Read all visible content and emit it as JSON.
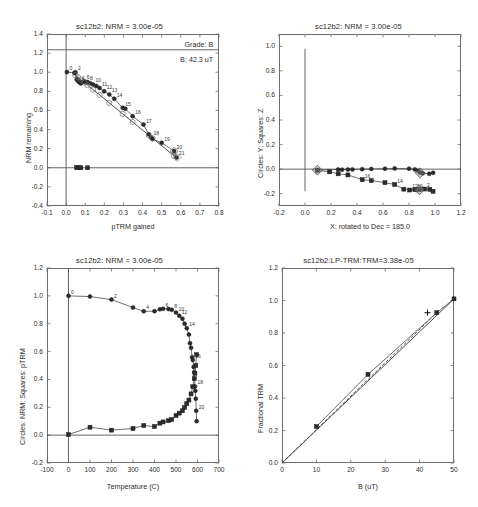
{
  "figure": {
    "width": 478,
    "height": 507,
    "background": "#ffffff",
    "specimen": "sc12b2"
  },
  "chart_data": [
    {
      "id": "arai-plot",
      "type": "scatter",
      "title": "sc12b2: NRM = 3.00e-05",
      "xlabel": "pTRM gained",
      "ylabel": "NRM remaining",
      "xlim": [
        -0.1,
        0.8
      ],
      "ylim": [
        -0.4,
        1.4
      ],
      "xticks": [
        "-0.1",
        "0.0",
        "0.1",
        "0.2",
        "0.3",
        "0.4",
        "0.5",
        "0.6",
        "0.7",
        "0.8"
      ],
      "yticks": [
        "-0.4",
        "-0.2",
        "0.0",
        "0.2",
        "0.4",
        "0.6",
        "0.8",
        "1.0",
        "1.2",
        "1.4"
      ],
      "grid": false,
      "annotations": [
        {
          "name": "grade-annotation",
          "text": "Grade: B",
          "x": 0.77,
          "y": 1.28
        },
        {
          "name": "field-annotation",
          "text": "B: 42.3 uT",
          "x": 0.77,
          "y": 1.13
        }
      ],
      "hlines": [
        1.235,
        0.0
      ],
      "vlines": [
        0.0
      ],
      "series": [
        {
          "name": "nrm-ptrm-circles",
          "marker": "circle",
          "points": [
            {
              "x": 0.004,
              "y": 1.002,
              "label": "0"
            },
            {
              "x": 0.043,
              "y": 0.992,
              "label": ""
            },
            {
              "x": 0.049,
              "y": 0.999,
              "label": "2"
            },
            {
              "x": 0.055,
              "y": 0.925,
              "label": ""
            },
            {
              "x": 0.062,
              "y": 0.908,
              "label": ""
            },
            {
              "x": 0.069,
              "y": 0.895,
              "label": "4"
            },
            {
              "x": 0.077,
              "y": 0.883,
              "label": ""
            },
            {
              "x": 0.086,
              "y": 0.9,
              "label": ""
            },
            {
              "x": 0.095,
              "y": 0.905,
              "label": "6"
            },
            {
              "x": 0.104,
              "y": 0.894,
              "label": ""
            },
            {
              "x": 0.112,
              "y": 0.898,
              "label": "8"
            },
            {
              "x": 0.126,
              "y": 0.885,
              "label": ""
            },
            {
              "x": 0.141,
              "y": 0.872,
              "label": "10"
            },
            {
              "x": 0.158,
              "y": 0.857,
              "label": ""
            },
            {
              "x": 0.175,
              "y": 0.836,
              "label": "11"
            },
            {
              "x": 0.199,
              "y": 0.8,
              "label": "12"
            },
            {
              "x": 0.226,
              "y": 0.768,
              "label": "13"
            },
            {
              "x": 0.252,
              "y": 0.722,
              "label": "14"
            },
            {
              "x": 0.296,
              "y": 0.627,
              "label": "15"
            },
            {
              "x": 0.31,
              "y": 0.618,
              "label": ""
            },
            {
              "x": 0.348,
              "y": 0.54,
              "label": "16"
            },
            {
              "x": 0.405,
              "y": 0.452,
              "label": "17"
            },
            {
              "x": 0.432,
              "y": 0.35,
              "label": ""
            },
            {
              "x": 0.444,
              "y": 0.318,
              "label": "18"
            },
            {
              "x": 0.452,
              "y": 0.3,
              "label": ""
            },
            {
              "x": 0.5,
              "y": 0.262,
              "label": "19"
            },
            {
              "x": 0.565,
              "y": 0.175,
              "label": "20"
            },
            {
              "x": 0.578,
              "y": 0.108,
              "label": "21"
            }
          ]
        },
        {
          "name": "ptrm-check-squares",
          "marker": "square",
          "points": [
            {
              "x": 0.055,
              "y": 0.002
            },
            {
              "x": 0.066,
              "y": 0.002
            },
            {
              "x": 0.077,
              "y": 0.0
            },
            {
              "x": 0.112,
              "y": 0.0
            }
          ]
        }
      ],
      "best_fit_line": {
        "x": [
          0.045,
          0.58
        ],
        "y": [
          0.975,
          0.1
        ]
      }
    },
    {
      "id": "zijderveld-plot",
      "type": "scatter",
      "title": "sc12b2: NRM = 3.00e-05",
      "xlabel": "X: rotated to Dec = 185.0",
      "ylabel": "Circles: Y; Squares: Z",
      "xlim": [
        -0.2,
        1.2
      ],
      "ylim": [
        -0.3,
        1.1
      ],
      "xticks": [
        "-0.2",
        "0.0",
        "0.2",
        "0.4",
        "0.6",
        "0.8",
        "1.0",
        "1.2"
      ],
      "yticks": [
        "-0.2",
        "0.0",
        "0.2",
        "0.4",
        "0.6",
        "0.8",
        "1.0"
      ],
      "grid": false,
      "hlines": [
        0.0
      ],
      "vlines": [
        0.0
      ],
      "series": [
        {
          "name": "y-component-circles",
          "marker": "circle",
          "points": [
            {
              "x": 0.095,
              "y": -0.007,
              "label": ""
            },
            {
              "x": 0.255,
              "y": -0.003,
              "label": ""
            },
            {
              "x": 0.285,
              "y": -0.004,
              "label": ""
            },
            {
              "x": 0.33,
              "y": -0.003,
              "label": ""
            },
            {
              "x": 0.365,
              "y": -0.002,
              "label": ""
            },
            {
              "x": 0.44,
              "y": 0.0,
              "label": ""
            },
            {
              "x": 0.51,
              "y": 0.002,
              "label": ""
            },
            {
              "x": 0.615,
              "y": 0.004,
              "label": ""
            },
            {
              "x": 0.69,
              "y": 0.006,
              "label": ""
            },
            {
              "x": 0.8,
              "y": 0.004,
              "label": ""
            },
            {
              "x": 0.845,
              "y": -0.002,
              "label": ""
            },
            {
              "x": 0.87,
              "y": -0.014,
              "label": ""
            },
            {
              "x": 0.885,
              "y": -0.028,
              "label": ""
            },
            {
              "x": 0.905,
              "y": -0.034,
              "label": ""
            },
            {
              "x": 0.955,
              "y": -0.038,
              "label": ""
            },
            {
              "x": 0.985,
              "y": -0.03,
              "label": ""
            }
          ]
        },
        {
          "name": "z-component-squares",
          "marker": "square",
          "points": [
            {
              "x": 0.095,
              "y": -0.01,
              "label": ""
            },
            {
              "x": 0.19,
              "y": -0.022,
              "label": ""
            },
            {
              "x": 0.255,
              "y": -0.038,
              "label": ""
            },
            {
              "x": 0.33,
              "y": -0.047,
              "label": ""
            },
            {
              "x": 0.44,
              "y": -0.086,
              "label": "16"
            },
            {
              "x": 0.51,
              "y": -0.093,
              "label": ""
            },
            {
              "x": 0.615,
              "y": -0.11,
              "label": ""
            },
            {
              "x": 0.69,
              "y": -0.125,
              "label": "14"
            },
            {
              "x": 0.76,
              "y": -0.163,
              "label": ""
            },
            {
              "x": 0.805,
              "y": -0.17,
              "label": "12"
            },
            {
              "x": 0.845,
              "y": -0.167,
              "label": "10"
            },
            {
              "x": 0.88,
              "y": -0.168,
              "label": ""
            },
            {
              "x": 0.92,
              "y": -0.162,
              "label": "2"
            },
            {
              "x": 0.96,
              "y": -0.165,
              "label": ""
            },
            {
              "x": 0.985,
              "y": -0.18,
              "label": ""
            }
          ]
        }
      ]
    },
    {
      "id": "nrm-ptrm-vs-temperature",
      "type": "line",
      "title": "sc12b2: NRM = 3.00e-05",
      "xlabel": "Temperature (C)",
      "ylabel": "Circles: NRM; Squares: pTRM",
      "xlim": [
        -100,
        700
      ],
      "ylim": [
        -0.2,
        1.2
      ],
      "xticks": [
        "-100",
        "0",
        "100",
        "200",
        "300",
        "400",
        "500",
        "600",
        "700"
      ],
      "yticks": [
        "-0.2",
        "0.0",
        "0.2",
        "0.4",
        "0.6",
        "0.8",
        "1.0",
        "1.2"
      ],
      "grid": false,
      "hlines": [
        0.0
      ],
      "vlines": [
        0.0
      ],
      "series": [
        {
          "name": "nrm-remaining",
          "marker": "circle",
          "points": [
            {
              "x": 0,
              "y": 1.0,
              "label": "0"
            },
            {
              "x": 100,
              "y": 0.995,
              "label": ""
            },
            {
              "x": 200,
              "y": 0.973,
              "label": "2"
            },
            {
              "x": 300,
              "y": 0.916,
              "label": ""
            },
            {
              "x": 350,
              "y": 0.889,
              "label": "4"
            },
            {
              "x": 400,
              "y": 0.89,
              "label": ""
            },
            {
              "x": 425,
              "y": 0.903,
              "label": ""
            },
            {
              "x": 440,
              "y": 0.907,
              "label": "6"
            },
            {
              "x": 465,
              "y": 0.905,
              "label": ""
            },
            {
              "x": 480,
              "y": 0.9,
              "label": "8"
            },
            {
              "x": 500,
              "y": 0.88,
              "label": "10"
            },
            {
              "x": 515,
              "y": 0.857,
              "label": "12"
            },
            {
              "x": 530,
              "y": 0.836,
              "label": ""
            },
            {
              "x": 540,
              "y": 0.8,
              "label": ""
            },
            {
              "x": 550,
              "y": 0.768,
              "label": "14"
            },
            {
              "x": 560,
              "y": 0.722,
              "label": ""
            },
            {
              "x": 565,
              "y": 0.66,
              "label": ""
            },
            {
              "x": 570,
              "y": 0.627,
              "label": ""
            },
            {
              "x": 575,
              "y": 0.56,
              "label": ""
            },
            {
              "x": 578,
              "y": 0.54,
              "label": "16"
            },
            {
              "x": 582,
              "y": 0.49,
              "label": ""
            },
            {
              "x": 585,
              "y": 0.452,
              "label": ""
            },
            {
              "x": 588,
              "y": 0.35,
              "label": "18"
            },
            {
              "x": 590,
              "y": 0.318,
              "label": ""
            },
            {
              "x": 592,
              "y": 0.262,
              "label": ""
            },
            {
              "x": 594,
              "y": 0.175,
              "label": "20"
            },
            {
              "x": 596,
              "y": 0.1,
              "label": ""
            }
          ]
        },
        {
          "name": "ptrm-gained",
          "marker": "square",
          "points": [
            {
              "x": 0,
              "y": 0.004,
              "label": ""
            },
            {
              "x": 100,
              "y": 0.057,
              "label": ""
            },
            {
              "x": 200,
              "y": 0.036,
              "label": ""
            },
            {
              "x": 300,
              "y": 0.048,
              "label": ""
            },
            {
              "x": 350,
              "y": 0.069,
              "label": ""
            },
            {
              "x": 400,
              "y": 0.062,
              "label": ""
            },
            {
              "x": 425,
              "y": 0.086,
              "label": ""
            },
            {
              "x": 440,
              "y": 0.095,
              "label": ""
            },
            {
              "x": 465,
              "y": 0.104,
              "label": ""
            },
            {
              "x": 480,
              "y": 0.112,
              "label": ""
            },
            {
              "x": 500,
              "y": 0.141,
              "label": ""
            },
            {
              "x": 515,
              "y": 0.158,
              "label": ""
            },
            {
              "x": 530,
              "y": 0.175,
              "label": ""
            },
            {
              "x": 540,
              "y": 0.199,
              "label": ""
            },
            {
              "x": 550,
              "y": 0.226,
              "label": ""
            },
            {
              "x": 560,
              "y": 0.252,
              "label": ""
            },
            {
              "x": 570,
              "y": 0.296,
              "label": ""
            },
            {
              "x": 578,
              "y": 0.348,
              "label": ""
            },
            {
              "x": 585,
              "y": 0.405,
              "label": ""
            },
            {
              "x": 588,
              "y": 0.444,
              "label": ""
            },
            {
              "x": 592,
              "y": 0.5,
              "label": ""
            },
            {
              "x": 596,
              "y": 0.578,
              "label": ""
            }
          ]
        }
      ]
    },
    {
      "id": "trm-acquisition",
      "type": "scatter",
      "title": "sc12b2:LP-TRM:TRM=3.38e-05",
      "xlabel": "B (uT)",
      "ylabel": "Fractional TRM",
      "xlim": [
        0,
        50
      ],
      "ylim": [
        0,
        1.2
      ],
      "xticks": [
        "0",
        "10",
        "20",
        "30",
        "40",
        "50"
      ],
      "yticks": [
        "0.0",
        "0.2",
        "0.4",
        "0.6",
        "0.8",
        "1.0",
        "1.2"
      ],
      "grid": false,
      "series": [
        {
          "name": "trm-acquisition-points",
          "marker": "square",
          "points": [
            {
              "x": 10,
              "y": 0.224
            },
            {
              "x": 25,
              "y": 0.545
            },
            {
              "x": 45,
              "y": 0.925
            },
            {
              "x": 50,
              "y": 1.01
            }
          ]
        },
        {
          "name": "best-field-estimate",
          "marker": "plus",
          "points": [
            {
              "x": 42.3,
              "y": 0.925
            }
          ]
        }
      ],
      "solid_line": {
        "x": [
          0,
          50
        ],
        "y": [
          0.0,
          1.01
        ]
      },
      "dashed_line": {
        "x": [
          0,
          45
        ],
        "y": [
          0.0,
          0.925
        ]
      }
    }
  ]
}
